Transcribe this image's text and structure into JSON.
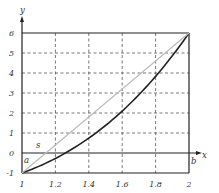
{
  "chart_data": {
    "type": "line",
    "title": "",
    "xlabel": "x",
    "ylabel": "y",
    "xlim": [
      1,
      2
    ],
    "ylim": [
      -1,
      6
    ],
    "grid": true,
    "grid_style": "dashed",
    "x_ticks": [
      "1",
      "1.2",
      "1.4",
      "1.6",
      "1.8",
      "2"
    ],
    "y_ticks": [
      "-1",
      "0",
      "1",
      "2",
      "3",
      "4",
      "5",
      "6"
    ],
    "series": [
      {
        "name": "curve",
        "color": "#222222",
        "x": [
          1.0,
          1.1,
          1.2,
          1.26,
          1.3,
          1.4,
          1.5,
          1.6,
          1.7,
          1.8,
          1.9,
          2.0
        ],
        "values": [
          -1.0,
          -0.67,
          -0.27,
          0.0,
          0.2,
          0.74,
          1.38,
          2.1,
          2.91,
          3.83,
          4.86,
          6.0
        ]
      },
      {
        "name": "secant",
        "label": "s",
        "color": "#bbbbbb",
        "x": [
          1.0,
          2.0
        ],
        "values": [
          -1.0,
          6.0
        ]
      }
    ],
    "annotations": [
      {
        "text": "a",
        "x": 1.0,
        "y": 0,
        "position": "below-right of origin on x-axis"
      },
      {
        "text": "b",
        "x": 2.0,
        "y": 0,
        "position": "below x-axis at x=2"
      },
      {
        "text": "s",
        "x": 1.1,
        "y": 0.35,
        "position": "near secant line"
      }
    ]
  },
  "labels": {
    "x_axis": "x",
    "y_axis": "y",
    "a": "a",
    "b": "b",
    "s": "s"
  }
}
